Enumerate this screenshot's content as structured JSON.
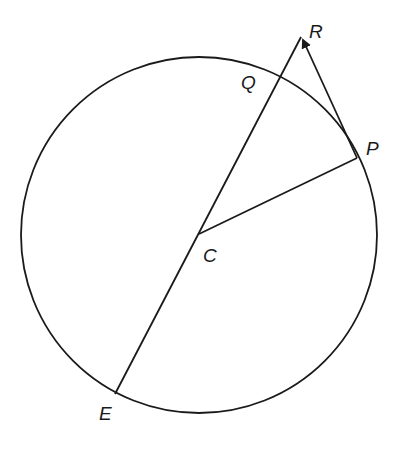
{
  "diagram": {
    "type": "circle-geometry",
    "circle": {
      "center": [
        199,
        235
      ],
      "radius": 178,
      "stroke": "#1a1a1a"
    },
    "points": {
      "C": {
        "label": "C",
        "xy": [
          199,
          234
        ],
        "label_xy": [
          203,
          262
        ]
      },
      "P": {
        "label": "P",
        "xy": [
          357,
          158
        ],
        "label_xy": [
          366,
          155
        ]
      },
      "Q": {
        "label": "Q",
        "xy": [
          283,
          73
        ],
        "label_xy": [
          241,
          89
        ]
      },
      "R": {
        "label": "R",
        "xy": [
          301,
          37
        ],
        "label_xy": [
          309,
          38
        ]
      },
      "E": {
        "label": "E",
        "xy": [
          115,
          394
        ],
        "label_xy": [
          99,
          420
        ]
      }
    },
    "segments": [
      {
        "name": "segment-ER",
        "from": "E",
        "to": "R"
      },
      {
        "name": "segment-CP",
        "from": "C",
        "to": "P"
      },
      {
        "name": "segment-PR",
        "from": "P",
        "to": "R",
        "arrow": "R"
      }
    ]
  }
}
